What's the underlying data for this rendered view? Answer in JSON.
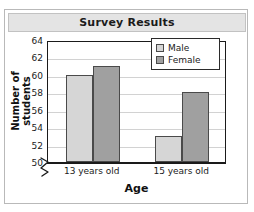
{
  "card": {
    "title": "Survey Results"
  },
  "chart_data": {
    "type": "bar",
    "title": "Survey Results",
    "xlabel": "Age",
    "ylabel": "Number of students",
    "categories": [
      "13 years old",
      "15 years old"
    ],
    "series": [
      {
        "name": "Male",
        "values": [
          60,
          53
        ],
        "color": "#d6d6d6"
      },
      {
        "name": "Female",
        "values": [
          61,
          58
        ],
        "color": "#a0a0a0"
      }
    ],
    "ylim": [
      50,
      64
    ],
    "ytick_step": 2,
    "yticks": [
      50,
      52,
      54,
      56,
      58,
      60,
      62,
      64
    ],
    "ytick_labels": [
      "50",
      "52",
      "54",
      "56",
      "58",
      "60",
      "62",
      "64"
    ],
    "axis_break": true,
    "axis_break_icon": "zigzag-axis-break",
    "grid": true,
    "grid_axis": "y",
    "legend_position": "top-right",
    "bar_edge_color": "#4a4a4a",
    "axis_color": "#1a1a1a",
    "gridline_color": "#d2d2d2",
    "plot_background": "#ffffff",
    "title_bar_background": "#e4e4e4"
  }
}
